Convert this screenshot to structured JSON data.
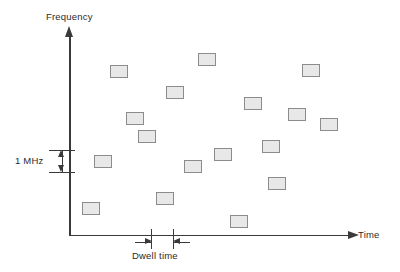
{
  "chart_data": {
    "type": "scatter",
    "title": "",
    "xlabel": "Time",
    "ylabel": "Frequency",
    "grid": false,
    "legend": null,
    "marker_shape": "rectangle",
    "marker_width_units": "1 dwell time",
    "marker_height_units": "1 MHz",
    "marker_fill": "#e8e8e8",
    "marker_stroke": "#8c8c8c",
    "axis_color": "#3a3a3a",
    "xlim": [
      0,
      17
    ],
    "ylim": [
      0,
      13
    ],
    "points": [
      {
        "x": 2.3,
        "y": 10.0,
        "px": 110,
        "py": 65
      },
      {
        "x": 6.6,
        "y": 10.9,
        "px": 198,
        "py": 53
      },
      {
        "x": 11.9,
        "y": 10.0,
        "px": 302,
        "py": 64
      },
      {
        "x": 4.9,
        "y": 8.4,
        "px": 166,
        "py": 86
      },
      {
        "x": 8.9,
        "y": 7.6,
        "px": 244,
        "py": 97
      },
      {
        "x": 2.9,
        "y": 6.4,
        "px": 126,
        "py": 112
      },
      {
        "x": 11.2,
        "y": 6.8,
        "px": 288,
        "py": 108
      },
      {
        "x": 3.5,
        "y": 5.0,
        "px": 138,
        "py": 130
      },
      {
        "x": 10.0,
        "y": 4.2,
        "px": 262,
        "py": 140
      },
      {
        "x": 7.4,
        "y": 3.6,
        "px": 214,
        "py": 148
      },
      {
        "x": 1.3,
        "y": 3.1,
        "px": 94,
        "py": 155
      },
      {
        "x": 5.9,
        "y": 2.7,
        "px": 184,
        "py": 160
      },
      {
        "x": 10.6,
        "y": 1.6,
        "px": 268,
        "py": 177
      },
      {
        "x": 4.4,
        "y": 1.6,
        "px": 156,
        "py": 192
      },
      {
        "x": 0.7,
        "y": 0.6,
        "px": 82,
        "py": 202
      },
      {
        "x": 8.1,
        "y": 0.1,
        "px": 230,
        "py": 215
      },
      {
        "x": 13.0,
        "y": 6.0,
        "px": 320,
        "py": 118
      }
    ]
  },
  "diagram": {
    "y_axis_label": "Frequency",
    "x_axis_label": "Time",
    "frequency_span_label": "1 MHz",
    "dwell_time_label": "Dwell time"
  }
}
